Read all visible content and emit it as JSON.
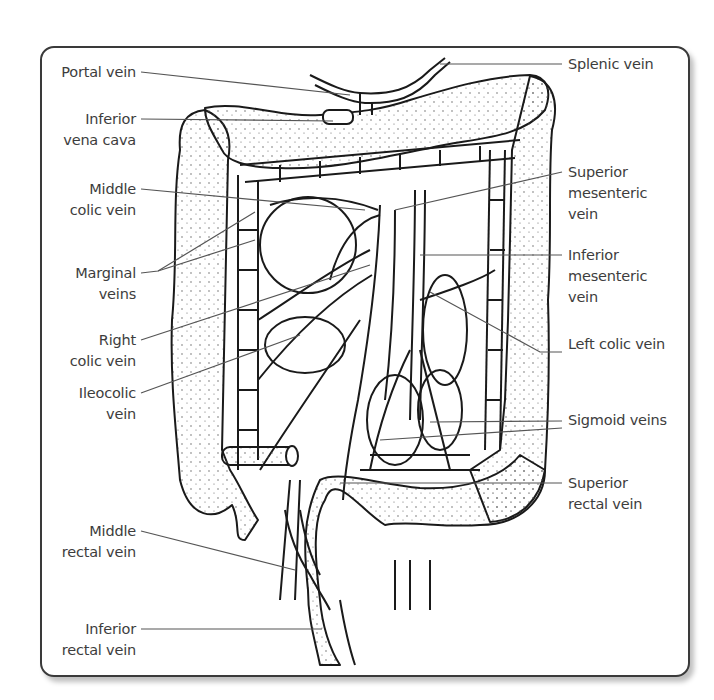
{
  "figure": {
    "labels_left": [
      {
        "id": "portal-vein",
        "text": "Portal vein"
      },
      {
        "id": "inferior-vena-cava",
        "text": "Inferior\nvena cava"
      },
      {
        "id": "middle-colic-vein",
        "text": "Middle\ncolic vein"
      },
      {
        "id": "marginal-veins",
        "text": "Marginal\nveins"
      },
      {
        "id": "right-colic-vein",
        "text": "Right\ncolic vein"
      },
      {
        "id": "ileocolic-vein",
        "text": "Ileocolic\nvein"
      },
      {
        "id": "middle-rectal-vein",
        "text": "Middle\nrectal vein"
      },
      {
        "id": "inferior-rectal-vein",
        "text": "Inferior\nrectal vein"
      }
    ],
    "labels_right": [
      {
        "id": "splenic-vein",
        "text": "Splenic vein"
      },
      {
        "id": "superior-mesenteric-vein",
        "text": "Superior\nmesenteric\nvein"
      },
      {
        "id": "inferior-mesenteric-vein",
        "text": "Inferior\nmesenteric\nvein"
      },
      {
        "id": "left-colic-vein",
        "text": "Left colic vein"
      },
      {
        "id": "sigmoid-veins",
        "text": "Sigmoid veins"
      },
      {
        "id": "superior-rectal-vein",
        "text": "Superior\nrectal vein"
      }
    ]
  },
  "colors": {
    "frame_border": "#3a3a3a",
    "label_text": "#3d3d3d",
    "leader_line": "#555555",
    "drawing_ink": "#1a1a1a",
    "stipple": "#444444"
  }
}
